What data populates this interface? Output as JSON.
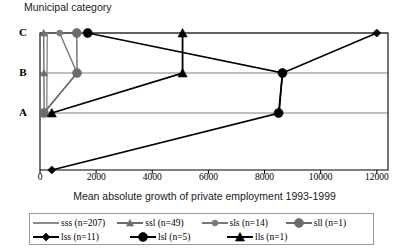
{
  "chart_data": {
    "type": "line",
    "title": "",
    "ylabel": "Municipal category",
    "xlabel": "Mean absolute growth of private employment 1993-1999",
    "orientation": "horizontal",
    "categories": [
      "A",
      "B",
      "C"
    ],
    "category_axis_labels": [
      "C",
      "B",
      "A"
    ],
    "xlim": [
      0,
      12400
    ],
    "xticks": [
      0,
      2000,
      4000,
      6000,
      8000,
      10000,
      12000
    ],
    "xtick_labels": [
      "0",
      "2000",
      "4000",
      "6000",
      "8000",
      "10000",
      "12000"
    ],
    "grid": "horizontal",
    "legend_position": "bottom",
    "series": [
      {
        "name": "sss",
        "label": "sss (n=207)",
        "n": 207,
        "color": "#8c8c8c",
        "marker": "line",
        "marker_size": 0,
        "line_width": 1.4,
        "points": [
          {
            "category": "C",
            "value": 260
          },
          {
            "category": "B",
            "value": 250
          },
          {
            "category": "A",
            "value": 240
          }
        ]
      },
      {
        "name": "ssl",
        "label": "ssl (n=49)",
        "n": 49,
        "color": "#6e6e6e",
        "marker": "triangle",
        "marker_size": 6,
        "line_width": 1.4,
        "points": [
          {
            "category": "C",
            "value": 130
          },
          {
            "category": "B",
            "value": 140
          },
          {
            "category": "A",
            "value": 150
          }
        ]
      },
      {
        "name": "sls",
        "label": "sls (n=14)",
        "n": 14,
        "color": "#7a7a7a",
        "marker": "circle",
        "marker_size": 6,
        "line_width": 1.4,
        "points": [
          {
            "category": "C",
            "value": 700
          },
          {
            "category": "B",
            "value": 1320
          },
          {
            "category": "A",
            "value": 130
          }
        ]
      },
      {
        "name": "sll",
        "label": "sll (n=1)",
        "n": 1,
        "color": "#6b6b6b",
        "marker": "circle",
        "marker_size": 9,
        "line_width": 1.4,
        "points": [
          {
            "category": "C",
            "value": 1310
          },
          {
            "category": "B",
            "value": 1320
          },
          {
            "category": "A",
            "value": 140
          }
        ]
      },
      {
        "name": "lss",
        "label": "lss (n=11)",
        "n": 11,
        "color": "#000000",
        "marker": "diamond",
        "marker_size": 8,
        "line_width": 1.6,
        "points": [
          {
            "category": "C",
            "value": 12000
          },
          {
            "category": "B",
            "value": 8640
          },
          {
            "category": "A",
            "value": 8520
          },
          {
            "category": "baseline",
            "value": 420
          }
        ]
      },
      {
        "name": "lsl",
        "label": "lsl (n=5)",
        "n": 5,
        "color": "#000000",
        "marker": "circle",
        "marker_size": 9,
        "line_width": 1.6,
        "points": [
          {
            "category": "C",
            "value": 1700
          },
          {
            "category": "B",
            "value": 8640
          },
          {
            "category": "A",
            "value": 8500
          }
        ]
      },
      {
        "name": "lls",
        "label": "lls (n=1)",
        "n": 1,
        "color": "#000000",
        "marker": "triangle",
        "marker_size": 8,
        "line_width": 1.8,
        "points": [
          {
            "category": "C",
            "value": 5080
          },
          {
            "category": "B",
            "value": 5080
          },
          {
            "category": "A",
            "value": 420
          }
        ]
      }
    ]
  }
}
